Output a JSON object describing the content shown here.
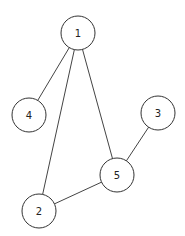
{
  "diagram": {
    "type": "undirected-graph",
    "node_radius": 17,
    "colors": {
      "background": "#ffffff",
      "edge": "#444444",
      "node_stroke": "#333333",
      "node_fill": "#ffffff",
      "label": "#222222"
    },
    "nodes": [
      {
        "id": "1",
        "label": "1",
        "x": 78,
        "y": 33
      },
      {
        "id": "4",
        "label": "4",
        "x": 29,
        "y": 115
      },
      {
        "id": "3",
        "label": "3",
        "x": 158,
        "y": 113
      },
      {
        "id": "5",
        "label": "5",
        "x": 117,
        "y": 175
      },
      {
        "id": "2",
        "label": "2",
        "x": 39,
        "y": 211
      }
    ],
    "edges": [
      {
        "from": "1",
        "to": "4"
      },
      {
        "from": "1",
        "to": "2"
      },
      {
        "from": "1",
        "to": "5"
      },
      {
        "from": "3",
        "to": "5"
      },
      {
        "from": "5",
        "to": "2"
      }
    ]
  }
}
